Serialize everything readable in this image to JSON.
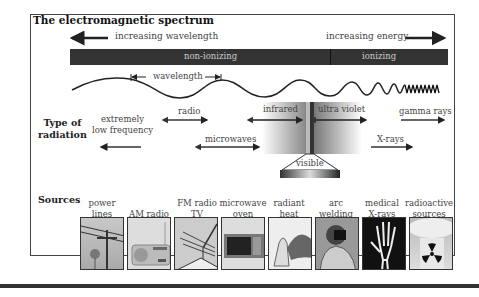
{
  "title": "The electromagnetic spectrum",
  "top_arrows": {
    "left": "increasing wavelength",
    "right": "increasing energy"
  },
  "band": {
    "left": "non-ionizing",
    "right": "ionizing"
  },
  "wavelength_label": "wavelength",
  "section_labels": {
    "type": "Type of radiation",
    "type_line1": "Type of",
    "type_line2": "radiation",
    "sources": "Sources"
  },
  "radiation_types": {
    "elf1": "extremely",
    "elf2": "low frequency",
    "radio": "radio",
    "microwaves": "microwaves",
    "infrared": "infrared",
    "visible": "visible",
    "ultraviolet": "ultra violet",
    "xrays": "X-rays",
    "gamma": "gamma rays"
  },
  "sources": [
    {
      "l1": "power",
      "l2": "lines",
      "icon": "power-lines-image"
    },
    {
      "l1": "",
      "l2": "AM radio",
      "icon": "am-radio-image"
    },
    {
      "l1": "FM radio",
      "l2": "TV",
      "icon": "tv-antenna-image"
    },
    {
      "l1": "microwave",
      "l2": "oven",
      "icon": "microwave-oven-image"
    },
    {
      "l1": "radiant",
      "l2": "heat",
      "icon": "radiant-heat-image"
    },
    {
      "l1": "arc",
      "l2": "welding",
      "icon": "arc-welding-image"
    },
    {
      "l1": "medical",
      "l2": "X-rays",
      "icon": "xray-hand-image"
    },
    {
      "l1": "radioactive",
      "l2": "sources",
      "icon": "radioactive-image"
    }
  ]
}
